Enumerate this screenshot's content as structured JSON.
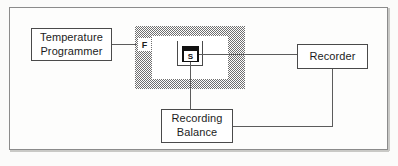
{
  "figure": {
    "type": "schematic-block-diagram",
    "width": 398,
    "height": 166,
    "background_color": "#fbfbfa",
    "frame_color": "#8b8b8b",
    "line_color": "#5c5c5c",
    "text_color": "#1c1c1c"
  },
  "nodes": {
    "temperature_programmer": {
      "name": "Temperature Programmer",
      "line1": "Temperature",
      "line2": "Programmer"
    },
    "recorder": {
      "name": "Recorder",
      "line1": "Recorder"
    },
    "recording_balance": {
      "name": "Recording Balance",
      "line1": "Recording",
      "line2": "Balance"
    },
    "furnace": {
      "name": "Furnace",
      "label": "F",
      "fill": "stipple",
      "fill_color": "#6f6f6f"
    },
    "sample": {
      "name": "Sample",
      "label": "S",
      "crucible_color": "#111111"
    }
  },
  "connections": [
    {
      "id": "programmer-to-furnace",
      "from": "Temperature Programmer",
      "to": "Furnace"
    },
    {
      "id": "sample-to-recorder",
      "from": "Sample",
      "to": "Recorder"
    },
    {
      "id": "sample-to-balance",
      "from": "Sample",
      "to": "Recording Balance"
    },
    {
      "id": "recorder-to-balance",
      "from": "Recorder",
      "to": "Recording Balance"
    }
  ]
}
